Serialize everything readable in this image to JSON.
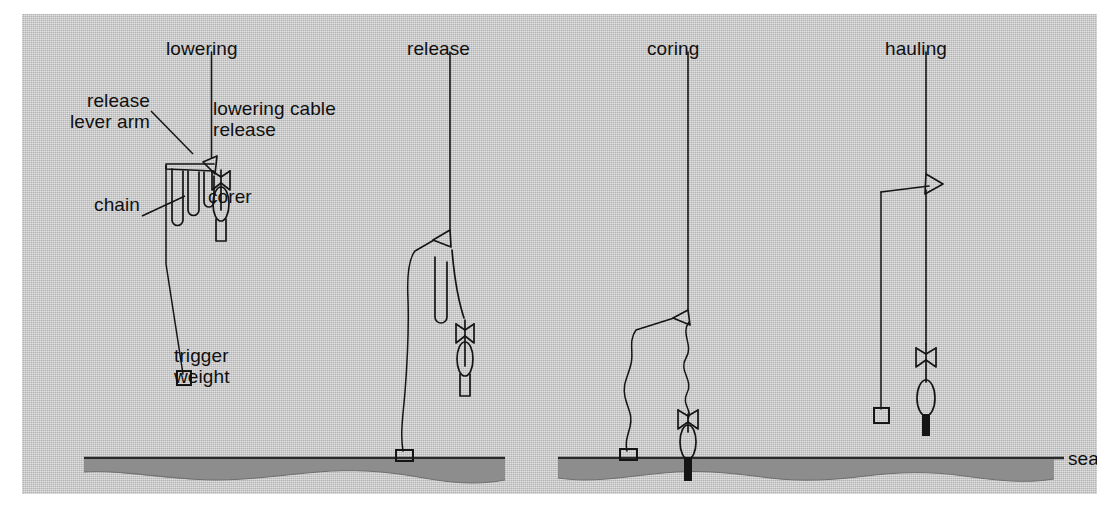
{
  "figure": {
    "background_color": "#c3c3c3",
    "ink_color": "#151515",
    "sediment_color": "#8d8d8d",
    "page_color": "#ffffff",
    "sea_bottom_label": "sea bottom"
  },
  "panels": [
    {
      "id": "lowering",
      "title": "lowering",
      "callouts": [
        {
          "name": "release-lever-arm",
          "line1": "release",
          "line2": "lever arm"
        },
        {
          "name": "lowering-cable-release",
          "line1": "lowering cable",
          "line2": "release"
        },
        {
          "name": "chain",
          "line1": "chain",
          "line2": ""
        },
        {
          "name": "corer",
          "line1": "corer",
          "line2": ""
        },
        {
          "name": "trigger-weight",
          "line1": "trigger",
          "line2": "weight"
        }
      ]
    },
    {
      "id": "release",
      "title": "release",
      "callouts": []
    },
    {
      "id": "coring",
      "title": "coring",
      "callouts": []
    },
    {
      "id": "hauling",
      "title": "hauling",
      "callouts": []
    }
  ],
  "labels": {
    "lowering": "lowering",
    "release": "release",
    "coring": "coring",
    "hauling": "hauling",
    "release_lever_arm_1": "release",
    "release_lever_arm_2": "lever arm",
    "lowering_cable_release_1": "lowering cable",
    "lowering_cable_release_2": "release",
    "chain": "chain",
    "corer": "corer",
    "trigger_weight_1": "trigger",
    "trigger_weight_2": "weight",
    "sea_bottom": "sea bottom"
  }
}
